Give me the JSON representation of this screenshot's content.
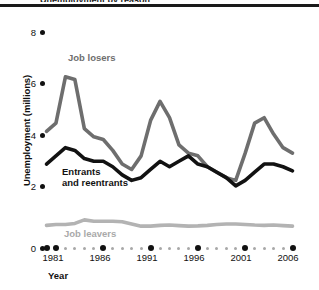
{
  "figure": {
    "clipped_header_text": "Unemployment by reason",
    "y_axis_title": "Unemployment (millions)",
    "x_axis_title": "Year"
  },
  "labels": {
    "job_losers": "Job losers",
    "entrants_line1": "Entrants",
    "entrants_line2": "and reentrants",
    "job_leavers": "Job leavers"
  },
  "colors": {
    "job_losers": "#6e6e6e",
    "entrants": "#121212",
    "job_leavers": "#b3b3b3",
    "axis": "#111111",
    "minor_tick": "#a8a8a8",
    "background": "#ffffff"
  },
  "chart_data": {
    "type": "line",
    "title": "Unemployment by reason",
    "xlabel": "Year",
    "ylabel": "Unemployment (millions)",
    "xlim": [
      1980,
      2006
    ],
    "ylim": [
      0,
      8
    ],
    "yticks": [
      0,
      2,
      4,
      6,
      8
    ],
    "xticks": [
      1981,
      1986,
      1991,
      1996,
      2001,
      2006
    ],
    "grid": false,
    "legend_position": "inline-annotations",
    "x": [
      1980,
      1981,
      1982,
      1983,
      1984,
      1985,
      1986,
      1987,
      1988,
      1989,
      1990,
      1991,
      1992,
      1993,
      1994,
      1995,
      1996,
      1997,
      1998,
      1999,
      2000,
      2001,
      2002,
      2003,
      2004,
      2005,
      2006
    ],
    "series": [
      {
        "name": "Job losers",
        "color": "#6e6e6e",
        "values": [
          4.3,
          4.6,
          6.3,
          6.2,
          4.4,
          4.1,
          4.0,
          3.6,
          3.1,
          2.9,
          3.4,
          4.7,
          5.4,
          4.8,
          3.8,
          3.5,
          3.4,
          3.0,
          2.8,
          2.6,
          2.5,
          3.5,
          4.6,
          4.8,
          4.2,
          3.7,
          3.5
        ]
      },
      {
        "name": "Entrants and reentrants",
        "color": "#121212",
        "values": [
          3.1,
          3.4,
          3.7,
          3.6,
          3.3,
          3.2,
          3.2,
          3.0,
          2.7,
          2.5,
          2.6,
          2.9,
          3.2,
          3.0,
          3.2,
          3.4,
          3.1,
          3.0,
          2.8,
          2.6,
          2.3,
          2.5,
          2.8,
          3.1,
          3.1,
          3.0,
          2.85
        ]
      },
      {
        "name": "Job leavers",
        "color": "#b3b3b3",
        "values": [
          0.85,
          0.88,
          0.88,
          0.92,
          1.05,
          1.0,
          1.0,
          1.0,
          0.98,
          0.9,
          0.82,
          0.82,
          0.85,
          0.86,
          0.84,
          0.82,
          0.83,
          0.85,
          0.88,
          0.9,
          0.9,
          0.88,
          0.86,
          0.85,
          0.86,
          0.84,
          0.82
        ]
      }
    ]
  }
}
